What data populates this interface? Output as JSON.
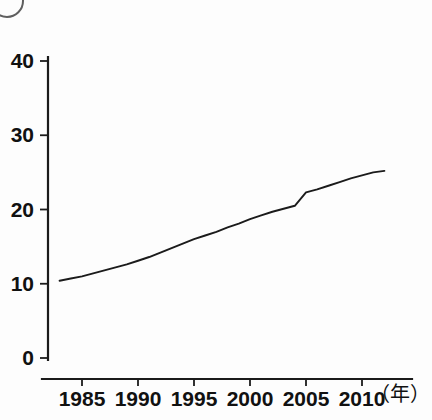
{
  "figure": {
    "corner_marker": "circled-number-partial"
  },
  "chart_data": {
    "type": "line",
    "title": "",
    "subtitle": "",
    "xlabel": "（年）",
    "ylabel": "",
    "grid": false,
    "legend": "none",
    "xlim": [
      1983,
      2012
    ],
    "ylim": [
      0,
      40
    ],
    "y_ticks": [
      0,
      10,
      20,
      30,
      40
    ],
    "y_tick_labels": [
      "0",
      "10",
      "20",
      "30",
      "40"
    ],
    "x_ticks": [
      1985,
      1990,
      1995,
      2000,
      2005,
      2010
    ],
    "x_tick_labels": [
      "1985",
      "1990",
      "1995",
      "2000",
      "2005",
      "2010"
    ],
    "axis_unit_label": "（年）",
    "series": [
      {
        "name": "",
        "color": "#1b1b1b",
        "x": [
          1983,
          1984,
          1985,
          1986,
          1987,
          1988,
          1989,
          1990,
          1991,
          1992,
          1993,
          1994,
          1995,
          1996,
          1997,
          1998,
          1999,
          2000,
          2001,
          2002,
          2003,
          2004,
          2005,
          2006,
          2007,
          2008,
          2009,
          2010,
          2011,
          2012
        ],
        "values": [
          10.4,
          10.7,
          11.0,
          11.4,
          11.8,
          12.2,
          12.6,
          13.1,
          13.6,
          14.2,
          14.8,
          15.4,
          16.0,
          16.5,
          17.0,
          17.6,
          18.1,
          18.7,
          19.2,
          19.7,
          20.1,
          20.5,
          22.3,
          22.7,
          23.2,
          23.7,
          24.2,
          24.6,
          25.0,
          25.2
        ]
      }
    ]
  },
  "axes_geometry": {
    "plot_left": 48,
    "plot_right": 412,
    "y_value_0_px": 358,
    "y_value_40_px": 61,
    "x_year_1985_px": 82,
    "x_year_2010_px": 362
  }
}
